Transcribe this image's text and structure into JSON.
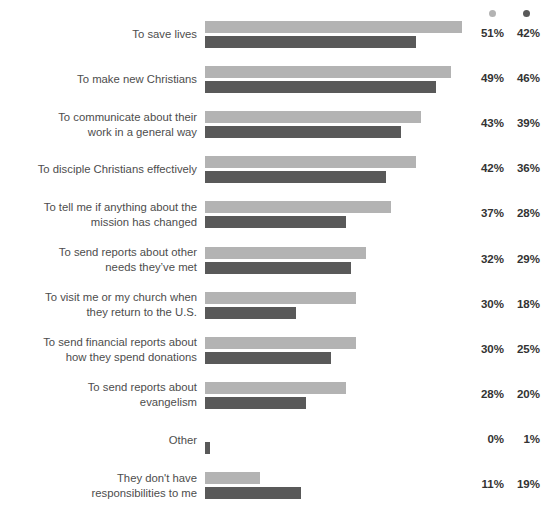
{
  "chart_data": {
    "type": "bar",
    "orientation": "horizontal",
    "title": "",
    "subtitle": "",
    "xlabel": "",
    "ylabel": "",
    "xlim": [
      0,
      60
    ],
    "grid": false,
    "legend_position": "top-right",
    "legend": [
      {
        "name": "series-a",
        "label": "",
        "marker": "dot",
        "color": "#b3b3b3"
      },
      {
        "name": "series-b",
        "label": "",
        "marker": "dot",
        "color": "#595959"
      }
    ],
    "value_suffix": "%",
    "categories": [
      "To save lives",
      "To make new Christians",
      "To communicate about their\nwork in a general way",
      "To disciple Christians effectively",
      "To tell me if anything about the\nmission has changed",
      "To send reports about other\nneeds they’ve met",
      "To visit me or my church when\nthey return to the U.S.",
      "To send financial reports about\nhow they spend donations",
      "To send reports about\nevangelism",
      "Other",
      "They don't have\nresponsibilities to me"
    ],
    "series": [
      {
        "name": "series-a",
        "color": "#b3b3b3",
        "values": [
          51,
          49,
          43,
          42,
          37,
          32,
          30,
          30,
          28,
          0,
          11
        ],
        "labels": [
          "51%",
          "49%",
          "43%",
          "42%",
          "37%",
          "32%",
          "30%",
          "30%",
          "28%",
          "0%",
          "11%"
        ]
      },
      {
        "name": "series-b",
        "color": "#595959",
        "values": [
          42,
          46,
          39,
          36,
          28,
          29,
          18,
          25,
          20,
          1,
          19
        ],
        "labels": [
          "42%",
          "46%",
          "39%",
          "36%",
          "28%",
          "29%",
          "18%",
          "25%",
          "20%",
          "1%",
          "19%"
        ]
      }
    ]
  },
  "colors": {
    "series_a": "#b3b3b3",
    "series_b": "#595959",
    "label_text": "#4d4d4d",
    "value_text": "#333333",
    "background": "#ffffff"
  }
}
